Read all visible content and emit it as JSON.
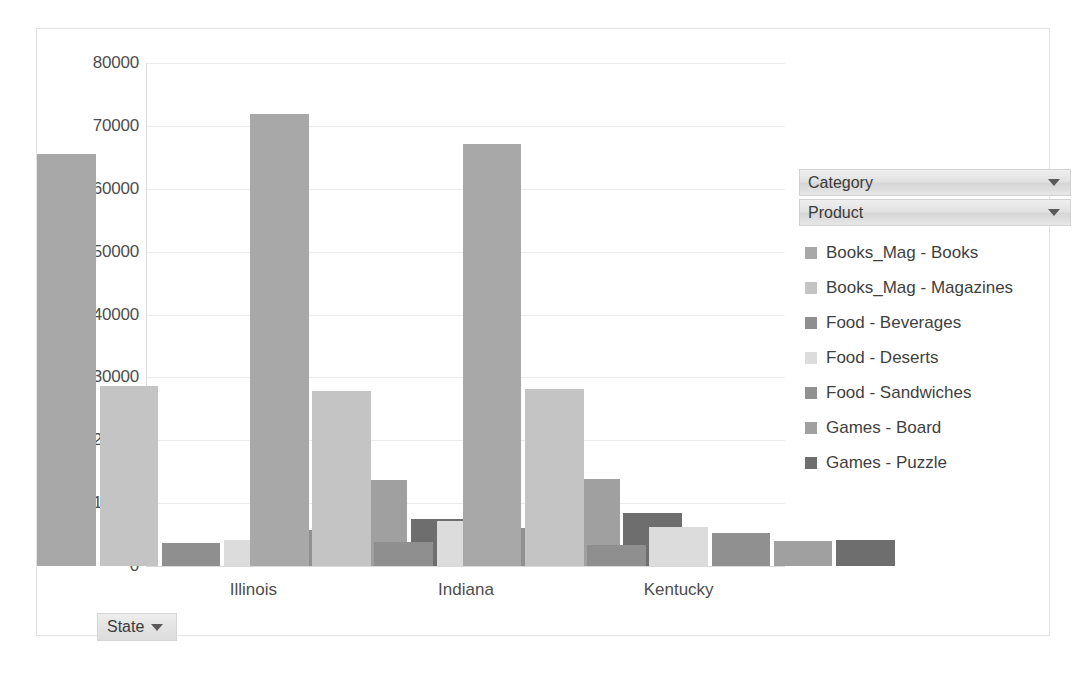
{
  "chart_data": {
    "type": "bar",
    "title": "",
    "xlabel": "State",
    "ylabel": "",
    "categories": [
      "Illinois",
      "Indiana",
      "Kentucky"
    ],
    "ylim": [
      0,
      80000
    ],
    "yticks": [
      0,
      10000,
      20000,
      30000,
      40000,
      50000,
      60000,
      70000,
      80000
    ],
    "ytick_labels": [
      "0",
      "10000",
      "20000",
      "30000",
      "40000",
      "50000",
      "60000",
      "70000",
      "80000"
    ],
    "grid": true,
    "legend_position": "right",
    "series": [
      {
        "name": "Books_Mag - Books",
        "color": "#a8a8a8",
        "values": [
          65500,
          71900,
          67100
        ]
      },
      {
        "name": "Books_Mag - Magazines",
        "color": "#c4c4c4",
        "values": [
          28700,
          27800,
          28200
        ]
      },
      {
        "name": "Food - Beverages",
        "color": "#8f8f8f",
        "values": [
          3700,
          3800,
          3300
        ]
      },
      {
        "name": "Food - Deserts",
        "color": "#dcdcdc",
        "values": [
          4200,
          7200,
          6200
        ]
      },
      {
        "name": "Food - Sandwiches",
        "color": "#909090",
        "values": [
          5700,
          6000,
          5200
        ]
      },
      {
        "name": "Games - Board",
        "color": "#a0a0a0",
        "values": [
          13700,
          13900,
          4000
        ]
      },
      {
        "name": "Games - Puzzle",
        "color": "#6e6e6e",
        "values": [
          7500,
          8500,
          4200
        ]
      }
    ]
  },
  "filters": {
    "category": {
      "label": "Category",
      "caret_icon": "chevron-down-icon"
    },
    "product": {
      "label": "Product",
      "caret_icon": "chevron-down-icon"
    },
    "state": {
      "label": "State",
      "caret_icon": "chevron-down-icon"
    }
  },
  "colors": {
    "frame_border": "#e3e3e3",
    "gridline": "#ececec",
    "axis_text": "#4d4d4d",
    "legend_text": "#3f3f3f"
  }
}
